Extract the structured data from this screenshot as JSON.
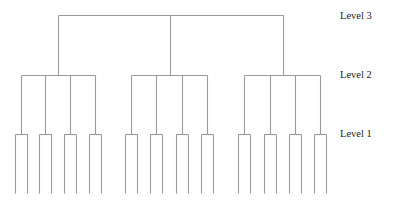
{
  "diagram": {
    "type": "hierarchy-tree",
    "line_color": "#9a9a9a",
    "levels": [
      {
        "label": "Level 3",
        "y": 15,
        "label_x": 340,
        "label_y": 10
      },
      {
        "label": "Level 2",
        "y": 75,
        "label_x": 340,
        "label_y": 69
      },
      {
        "label": "Level 1",
        "y": 134,
        "label_x": 340,
        "label_y": 128
      }
    ],
    "root": {
      "x": 170,
      "top": 15
    },
    "groups": [
      {
        "stem_x": 58,
        "branches": [
          21,
          45,
          70,
          95
        ]
      },
      {
        "stem_x": 170,
        "branches": [
          131,
          156,
          182,
          207
        ]
      },
      {
        "stem_x": 283,
        "branches": [
          244,
          270,
          295,
          320
        ]
      }
    ],
    "leaf_half_width": 6,
    "leaf_bottom": 193
  }
}
